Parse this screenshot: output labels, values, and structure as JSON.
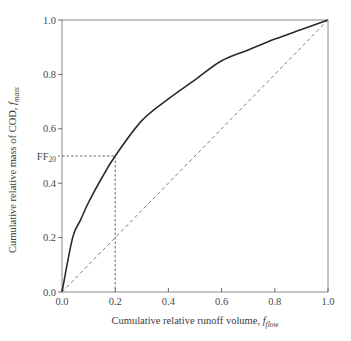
{
  "chart_data": {
    "type": "line",
    "title": "",
    "xlabel": "Cumulative relative runoff volume, f_flow",
    "ylabel": "Cumulative relative mass of COD, f_mass",
    "xlabel_main": "Cumulative relative runoff volume, ",
    "xlabel_var": "f",
    "xlabel_sub": "flow",
    "ylabel_main": "Cumulative relative mass of COD, ",
    "ylabel_var": "f",
    "ylabel_sub": "mass",
    "xlim": [
      0,
      1.0
    ],
    "ylim": [
      0,
      1.0
    ],
    "x_ticks": [
      0.0,
      0.2,
      0.4,
      0.6,
      0.8,
      1.0
    ],
    "x_tick_labels": [
      "0.0",
      "0.2",
      "0.4",
      "0.6",
      "0.8",
      "1.0"
    ],
    "y_ticks": [
      0.0,
      0.2,
      0.4,
      0.6,
      0.8,
      1.0
    ],
    "y_tick_labels": [
      "0.0",
      "0.2",
      "0.4",
      "0.6",
      "0.8",
      "1.0"
    ],
    "grid": false,
    "legend": null,
    "series": [
      {
        "name": "Mass-volume curve (first flush)",
        "style": "solid",
        "color": "#2a2a2a",
        "x": [
          0.0,
          0.04,
          0.07,
          0.1,
          0.15,
          0.2,
          0.3,
          0.4,
          0.5,
          0.6,
          0.7,
          0.8,
          0.9,
          1.0
        ],
        "y": [
          0.0,
          0.2,
          0.265,
          0.33,
          0.42,
          0.5,
          0.63,
          0.71,
          0.78,
          0.85,
          0.89,
          0.93,
          0.965,
          1.0
        ]
      },
      {
        "name": "1:1 line (no first flush)",
        "style": "dashed",
        "color": "#6a6a6a",
        "x": [
          0.0,
          1.0
        ],
        "y": [
          0.0,
          1.0
        ]
      }
    ],
    "annotations": [
      {
        "label_main": "FF",
        "label_sub": "20",
        "text": "FF20",
        "type": "dashed reference lines",
        "x": 0.2,
        "y": 0.5
      }
    ]
  }
}
